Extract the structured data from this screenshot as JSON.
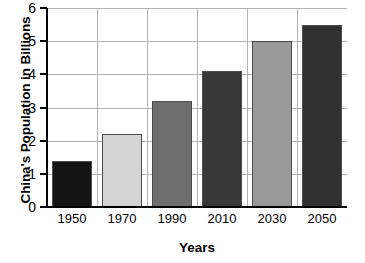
{
  "chart_data": {
    "type": "bar",
    "title": "",
    "categories": [
      "1950",
      "1970",
      "1990",
      "2010",
      "2030",
      "2050"
    ],
    "values": [
      1.4,
      2.2,
      3.2,
      4.1,
      5.0,
      5.5
    ],
    "xlabel": "Years",
    "ylabel": "China's Population in Billions",
    "ylim": [
      0,
      6
    ],
    "yticks": [
      "0",
      "1",
      "2",
      "3",
      "4",
      "5",
      "6"
    ],
    "ytick_values": [
      0,
      1,
      2,
      3,
      4,
      5,
      6
    ],
    "grid": true,
    "legend": "none",
    "bar_colors": [
      "#141414",
      "#d4d4d4",
      "#6e6e6e",
      "#383838",
      "#9a9a9a",
      "#303030"
    ],
    "bar_border_color": "#4d4d4d",
    "axis_color": "#000000",
    "gridline_color": "#b3b3b3",
    "background": "#ffffff"
  }
}
